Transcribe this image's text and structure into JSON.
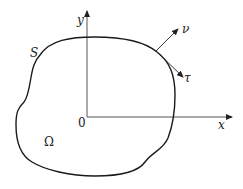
{
  "diagram": {
    "type": "domain-with-boundary",
    "labels": {
      "y_axis": "y",
      "x_axis": "x",
      "origin": "0",
      "boundary": "S",
      "region": "Ω",
      "normal": "ν",
      "tangent": "τ"
    },
    "colors": {
      "axes": "#555555",
      "boundary": "#1a1a1a",
      "vectors": "#222222",
      "text": "#222222"
    }
  }
}
